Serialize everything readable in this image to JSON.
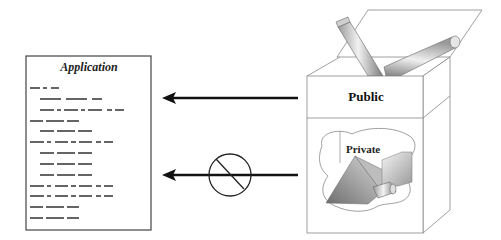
{
  "diagram": {
    "application": {
      "title": "Application"
    },
    "component": {
      "public_label": "Public",
      "private_label": "Private"
    },
    "connections": [
      {
        "from": "Public",
        "to": "Application",
        "type": "allowed-access-arrow"
      },
      {
        "from": "Private",
        "to": "Application",
        "type": "blocked-access-arrow",
        "marker": "prohibited-sign"
      }
    ]
  }
}
